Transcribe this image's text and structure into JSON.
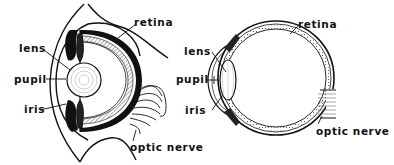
{
  "figure": {
    "left_diagram": {
      "labels": {
        "lens": "lens",
        "pupil": "pupil",
        "iris": "iris",
        "retina": "retina",
        "optic_nerve": "optic nerve"
      }
    },
    "right_diagram": {
      "labels": {
        "lens": "lens",
        "pupil": "pupil",
        "iris": "iris",
        "retina": "retina",
        "optic_nerve": "optic nerve"
      }
    },
    "colors": {
      "ink": "#111111",
      "background": "#ffffff"
    }
  }
}
